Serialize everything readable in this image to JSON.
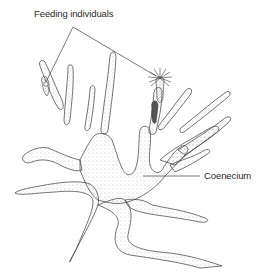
{
  "diagram": {
    "labels": [
      {
        "id": "feeding",
        "text": "Feeding individuals",
        "points_to": [
          "left-zooid",
          "right-zooid"
        ]
      },
      {
        "id": "coenecium",
        "text": "Coenecium",
        "points_to": [
          "colony-body"
        ]
      }
    ],
    "colors": {
      "outline": "#3a3a3a",
      "stipple": "#8a8a8a",
      "leader_line": "#555555",
      "background": "#ffffff"
    }
  }
}
